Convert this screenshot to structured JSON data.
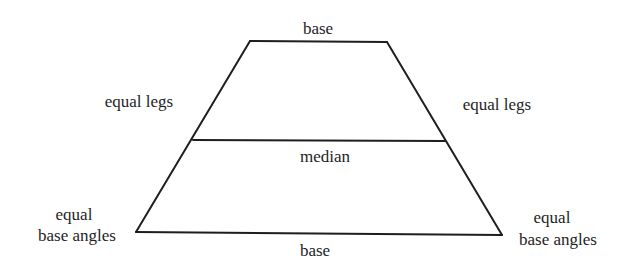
{
  "diagram": {
    "labels": {
      "top_base": "base",
      "bottom_base": "base",
      "left_leg": "equal legs",
      "right_leg": "equal legs",
      "median": "median",
      "left_angle_line1": "equal",
      "left_angle_line2": "base angles",
      "right_angle_line1": "equal",
      "right_angle_line2": "base angles"
    },
    "colors": {
      "stroke": "#1e1e1e",
      "text": "#1e1e1e",
      "background": "#ffffff"
    },
    "shape": {
      "top_left": [
        250,
        41
      ],
      "top_right": [
        387,
        42
      ],
      "bottom_right": [
        502,
        235
      ],
      "bottom_left": [
        136,
        232
      ],
      "median_left": [
        193,
        140
      ],
      "median_right": [
        445,
        141
      ]
    }
  }
}
